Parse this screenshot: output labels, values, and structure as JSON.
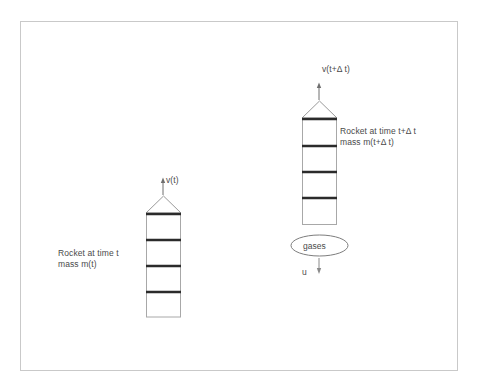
{
  "figure": {
    "background_color": "#ffffff",
    "frame_color": "#c9c9c9",
    "line_color": "#2b2b2b",
    "thin_line_color": "#9a9a9a",
    "text_color": "#4a4a4a"
  },
  "rocket_before": {
    "velocity_label": "v(t)",
    "caption_line1": "Rocket at time t",
    "caption_line2": "mass m(t)",
    "segments": 4
  },
  "rocket_after": {
    "velocity_label": "v(t+Δ t)",
    "caption_line1": "Rocket at time t+Δ t",
    "caption_line2": "mass m(t+Δ t)",
    "segments": 4
  },
  "exhaust": {
    "ellipse_label": "gases",
    "velocity_label": "u"
  }
}
